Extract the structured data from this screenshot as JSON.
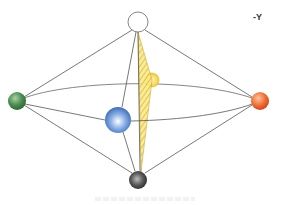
{
  "figure": {
    "axis_label": "-Y",
    "edge_color": "#555555",
    "plane": {
      "name": "hatched-plane",
      "color": "#e8c21a"
    },
    "vertices": [
      {
        "id": "top",
        "cx": 138,
        "cy": 22,
        "r": 10,
        "fill": "#ffffff",
        "stroke": "#777777",
        "style": "hollow"
      },
      {
        "id": "bottom",
        "cx": 138,
        "cy": 180,
        "r": 9,
        "fill": "#3a3a3a",
        "highlight": "#bdbdbd"
      },
      {
        "id": "left",
        "cx": 17,
        "cy": 101,
        "r": 9,
        "fill": "#2f6b35",
        "highlight": "#a8d3a8"
      },
      {
        "id": "right",
        "cx": 260,
        "cy": 101,
        "r": 9,
        "fill": "#e0531d",
        "highlight": "#ffc4a0"
      },
      {
        "id": "front",
        "cx": 118,
        "cy": 120,
        "r": 13,
        "fill": "#2f5fae",
        "highlight": "#e6f0ff"
      },
      {
        "id": "back",
        "cx": 152,
        "cy": 80,
        "r": 7,
        "fill": "#f2c21b",
        "highlight": "#fff6c8"
      }
    ],
    "edges": [
      [
        "top",
        "left"
      ],
      [
        "top",
        "right"
      ],
      [
        "top",
        "front"
      ],
      [
        "top",
        "back"
      ],
      [
        "bottom",
        "left"
      ],
      [
        "bottom",
        "right"
      ],
      [
        "bottom",
        "front"
      ],
      [
        "bottom",
        "back"
      ]
    ]
  }
}
